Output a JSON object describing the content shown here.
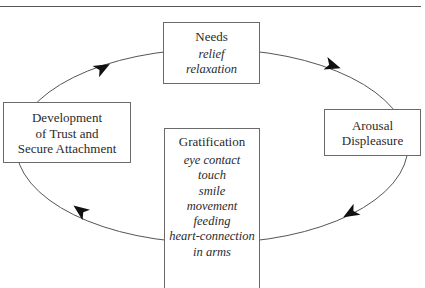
{
  "diagram": {
    "type": "cycle",
    "direction": "clockwise",
    "nodes": [
      {
        "id": "needs",
        "title": "Needs",
        "items": [
          "relief",
          "relaxation"
        ]
      },
      {
        "id": "arousal",
        "title_lines": [
          "Arousal",
          "Displeasure"
        ]
      },
      {
        "id": "gratification",
        "title": "Gratification",
        "items": [
          "eye contact",
          "touch",
          "smile",
          "movement",
          "feeding",
          "heart-connection",
          "in arms"
        ]
      },
      {
        "id": "trust",
        "title_lines": [
          "Development",
          "of Trust and",
          "Secure Attachment"
        ]
      }
    ],
    "edges": [
      {
        "from": "needs",
        "to": "arousal"
      },
      {
        "from": "arousal",
        "to": "gratification"
      },
      {
        "from": "gratification",
        "to": "trust"
      },
      {
        "from": "trust",
        "to": "needs"
      }
    ],
    "colors": {
      "line": "#555555",
      "arrow": "#111111",
      "box_border": "#6a6a6a",
      "text": "#2a2a2a"
    }
  }
}
